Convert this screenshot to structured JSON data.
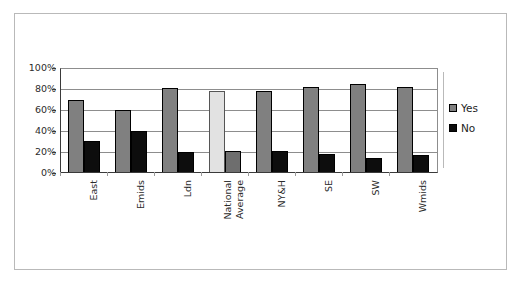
{
  "chart_data": {
    "type": "bar",
    "title": "",
    "subtitle": "",
    "xlabel": "",
    "ylabel": "",
    "categories": [
      "East",
      "Emids",
      "Ldn",
      "National Average",
      "NY&H",
      "SE",
      "SW",
      "Wmids"
    ],
    "series": [
      {
        "name": "Yes",
        "values": [
          70,
          61,
          82,
          79,
          79,
          83,
          86,
          83
        ],
        "color": "#808080"
      },
      {
        "name": "No",
        "values": [
          31,
          40,
          20,
          21,
          21,
          18,
          14,
          17
        ],
        "color": "#0d0d0d"
      }
    ],
    "highlight_category": "National Average",
    "highlight_colors": {
      "Yes": "#e2e2e2",
      "No": "#6e6e6e"
    },
    "ylim": [
      0,
      100
    ],
    "ytick_values": [
      0,
      20,
      40,
      60,
      80,
      100
    ],
    "ytick_labels": [
      "0%",
      "20%",
      "40%",
      "60%",
      "80%",
      "100%"
    ],
    "grid": true,
    "legend_position": "right",
    "legend_entries": [
      "Yes",
      "No"
    ]
  },
  "axes": {
    "y": {
      "ticks": [
        {
          "label": "100%",
          "value": 100
        },
        {
          "label": "80%",
          "value": 80
        },
        {
          "label": "60%",
          "value": 60
        },
        {
          "label": "40%",
          "value": 40
        },
        {
          "label": "20%",
          "value": 20
        },
        {
          "label": "0%",
          "value": 0
        }
      ]
    },
    "x": {
      "ticks": [
        {
          "line1": "East",
          "line2": ""
        },
        {
          "line1": "Emids",
          "line2": ""
        },
        {
          "line1": "Ldn",
          "line2": ""
        },
        {
          "line1": "National",
          "line2": "Average"
        },
        {
          "line1": "NY&H",
          "line2": ""
        },
        {
          "line1": "SE",
          "line2": ""
        },
        {
          "line1": "SW",
          "line2": ""
        },
        {
          "line1": "Wmids",
          "line2": ""
        }
      ]
    }
  },
  "legend": {
    "items": [
      {
        "label": "Yes",
        "color": "#808080"
      },
      {
        "label": "No",
        "color": "#0d0d0d"
      }
    ]
  },
  "colors": {
    "series_yes": "#808080",
    "series_no": "#0d0d0d",
    "highlight_yes": "#e2e2e2",
    "highlight_no": "#6e6e6e",
    "gridline": "#8d8d8d",
    "axis": "#3a3a3a",
    "frame": "#b9b9b9",
    "background": "#ffffff",
    "text": "#2b2b2b"
  }
}
